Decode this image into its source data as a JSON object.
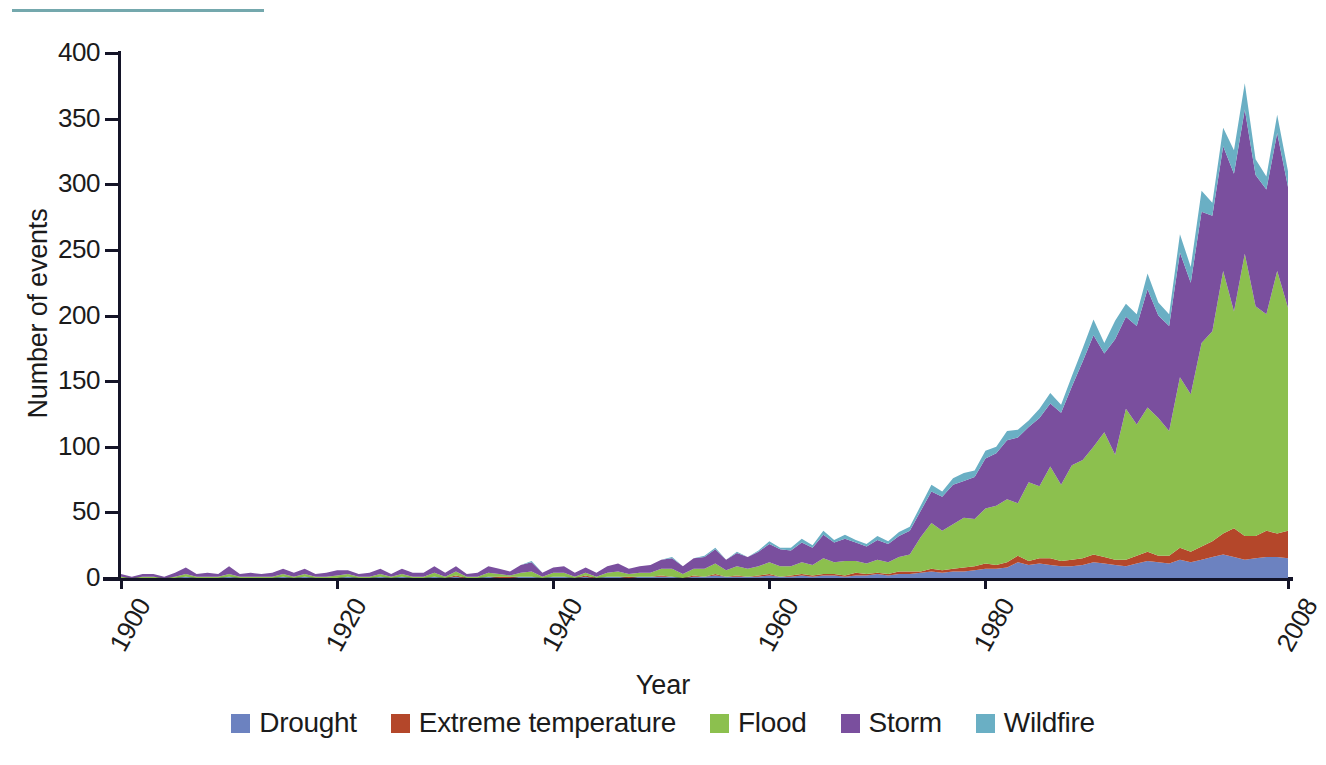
{
  "figure": {
    "rule_color": "#74a8ad"
  },
  "chart_data": {
    "type": "area",
    "stacked": true,
    "title": "",
    "xlabel": "Year",
    "ylabel": "Number of events",
    "xlim": [
      1900,
      2008
    ],
    "ylim": [
      0,
      400
    ],
    "yticks": [
      0,
      50,
      100,
      150,
      200,
      250,
      300,
      350,
      400
    ],
    "ytick_labels": [
      "0",
      "50",
      "100",
      "150",
      "200",
      "250",
      "300",
      "350",
      "400"
    ],
    "xticks": [
      1900,
      1920,
      1940,
      1960,
      1980,
      2008
    ],
    "xtick_labels": [
      "1900",
      "1920",
      "1940",
      "1960",
      "1980",
      "2008"
    ],
    "grid": false,
    "legend_position": "bottom",
    "colors": {
      "Drought": "#6c82c0",
      "Extreme temperature": "#b4472a",
      "Flood": "#8cc04e",
      "Storm": "#7a4f9e",
      "Wildfire": "#6aafc4"
    },
    "x": [
      1900,
      1901,
      1902,
      1903,
      1904,
      1905,
      1906,
      1907,
      1908,
      1909,
      1910,
      1911,
      1912,
      1913,
      1914,
      1915,
      1916,
      1917,
      1918,
      1919,
      1920,
      1921,
      1922,
      1923,
      1924,
      1925,
      1926,
      1927,
      1928,
      1929,
      1930,
      1931,
      1932,
      1933,
      1934,
      1935,
      1936,
      1937,
      1938,
      1939,
      1940,
      1941,
      1942,
      1943,
      1944,
      1945,
      1946,
      1947,
      1948,
      1949,
      1950,
      1951,
      1952,
      1953,
      1954,
      1955,
      1956,
      1957,
      1958,
      1959,
      1960,
      1961,
      1962,
      1963,
      1964,
      1965,
      1966,
      1967,
      1968,
      1969,
      1970,
      1971,
      1972,
      1973,
      1974,
      1975,
      1976,
      1977,
      1978,
      1979,
      1980,
      1981,
      1982,
      1983,
      1984,
      1985,
      1986,
      1987,
      1988,
      1989,
      1990,
      1991,
      1992,
      1993,
      1994,
      1995,
      1996,
      1997,
      1998,
      1999,
      2000,
      2001,
      2002,
      2003,
      2004,
      2005,
      2006,
      2007,
      2008
    ],
    "series": [
      {
        "name": "Drought",
        "values": [
          0,
          0,
          0,
          0,
          0,
          0,
          1,
          0,
          0,
          0,
          1,
          0,
          0,
          0,
          0,
          1,
          0,
          1,
          0,
          0,
          0,
          1,
          0,
          0,
          1,
          0,
          1,
          0,
          0,
          1,
          0,
          1,
          0,
          0,
          1,
          0,
          0,
          1,
          1,
          0,
          1,
          1,
          0,
          1,
          0,
          1,
          1,
          0,
          1,
          1,
          1,
          1,
          0,
          1,
          1,
          2,
          1,
          1,
          1,
          1,
          2,
          1,
          1,
          2,
          1,
          2,
          2,
          1,
          2,
          2,
          3,
          2,
          3,
          3,
          4,
          5,
          4,
          5,
          5,
          6,
          7,
          7,
          8,
          12,
          10,
          11,
          10,
          9,
          9,
          10,
          12,
          11,
          10,
          9,
          11,
          13,
          12,
          11,
          14,
          12,
          14,
          16,
          18,
          16,
          14,
          15,
          16,
          16,
          15
        ]
      },
      {
        "name": "Extreme temperature",
        "values": [
          0,
          0,
          0,
          0,
          0,
          0,
          0,
          0,
          0,
          0,
          0,
          0,
          0,
          0,
          0,
          0,
          0,
          0,
          0,
          0,
          0,
          0,
          0,
          0,
          0,
          0,
          0,
          0,
          0,
          0,
          0,
          1,
          0,
          0,
          0,
          1,
          1,
          0,
          0,
          0,
          0,
          0,
          0,
          1,
          0,
          0,
          0,
          1,
          0,
          0,
          1,
          0,
          0,
          1,
          0,
          1,
          0,
          1,
          0,
          1,
          1,
          0,
          1,
          1,
          1,
          1,
          1,
          1,
          2,
          1,
          1,
          1,
          2,
          2,
          1,
          2,
          2,
          2,
          3,
          3,
          4,
          3,
          4,
          5,
          3,
          4,
          5,
          4,
          5,
          5,
          6,
          5,
          4,
          5,
          6,
          7,
          5,
          6,
          9,
          8,
          10,
          12,
          16,
          22,
          18,
          17,
          20,
          18,
          21
        ]
      },
      {
        "name": "Flood",
        "values": [
          1,
          0,
          1,
          1,
          0,
          1,
          2,
          1,
          1,
          1,
          2,
          1,
          1,
          1,
          1,
          2,
          1,
          2,
          1,
          1,
          2,
          2,
          1,
          1,
          2,
          1,
          2,
          1,
          1,
          3,
          1,
          3,
          1,
          1,
          3,
          2,
          1,
          3,
          4,
          1,
          3,
          3,
          1,
          2,
          1,
          3,
          4,
          2,
          3,
          3,
          5,
          6,
          3,
          5,
          6,
          8,
          5,
          7,
          6,
          7,
          9,
          8,
          7,
          9,
          8,
          12,
          9,
          11,
          9,
          8,
          10,
          9,
          11,
          13,
          26,
          35,
          30,
          34,
          38,
          36,
          42,
          45,
          48,
          40,
          60,
          55,
          70,
          58,
          72,
          75,
          82,
          95,
          80,
          115,
          100,
          110,
          105,
          95,
          130,
          120,
          155,
          160,
          200,
          165,
          215,
          175,
          165,
          200,
          170
        ]
      },
      {
        "name": "Storm",
        "values": [
          2,
          1,
          2,
          2,
          1,
          3,
          5,
          2,
          3,
          2,
          6,
          2,
          3,
          2,
          3,
          4,
          3,
          4,
          2,
          3,
          4,
          3,
          2,
          3,
          4,
          2,
          4,
          3,
          3,
          5,
          3,
          4,
          2,
          3,
          5,
          4,
          3,
          6,
          7,
          3,
          4,
          5,
          3,
          4,
          3,
          5,
          6,
          4,
          5,
          6,
          7,
          8,
          6,
          8,
          9,
          11,
          8,
          10,
          9,
          11,
          14,
          13,
          12,
          15,
          13,
          18,
          15,
          17,
          14,
          13,
          15,
          14,
          16,
          18,
          20,
          24,
          26,
          30,
          28,
          32,
          38,
          40,
          45,
          50,
          42,
          52,
          48,
          55,
          60,
          75,
          85,
          60,
          88,
          70,
          75,
          90,
          78,
          80,
          95,
          85,
          100,
          88,
          95,
          105,
          110,
          100,
          95,
          105,
          92
        ]
      },
      {
        "name": "Wildfire",
        "values": [
          0,
          0,
          0,
          0,
          0,
          0,
          0,
          0,
          0,
          0,
          0,
          0,
          0,
          0,
          0,
          0,
          0,
          0,
          0,
          0,
          0,
          0,
          0,
          0,
          0,
          0,
          0,
          0,
          0,
          0,
          0,
          0,
          0,
          0,
          0,
          0,
          0,
          0,
          1,
          0,
          0,
          0,
          0,
          0,
          0,
          0,
          0,
          0,
          0,
          0,
          0,
          1,
          0,
          0,
          1,
          1,
          0,
          1,
          0,
          1,
          2,
          1,
          2,
          3,
          2,
          3,
          2,
          3,
          2,
          2,
          3,
          2,
          3,
          3,
          4,
          5,
          4,
          5,
          6,
          5,
          6,
          5,
          7,
          6,
          5,
          7,
          8,
          6,
          8,
          10,
          12,
          8,
          14,
          10,
          9,
          12,
          10,
          9,
          14,
          12,
          16,
          10,
          14,
          18,
          20,
          12,
          10,
          14,
          12
        ]
      }
    ]
  },
  "axis": {
    "ylabel_text": "Number of events",
    "xlabel_text": "Year"
  },
  "legend": {
    "items": [
      {
        "label": "Drought",
        "color": "#6c82c0",
        "icon": "legend-swatch-icon"
      },
      {
        "label": "Extreme temperature",
        "color": "#b4472a",
        "icon": "legend-swatch-icon"
      },
      {
        "label": "Flood",
        "color": "#8cc04e",
        "icon": "legend-swatch-icon"
      },
      {
        "label": "Storm",
        "color": "#7a4f9e",
        "icon": "legend-swatch-icon"
      },
      {
        "label": "Wildfire",
        "color": "#6aafc4",
        "icon": "legend-swatch-icon"
      }
    ]
  }
}
